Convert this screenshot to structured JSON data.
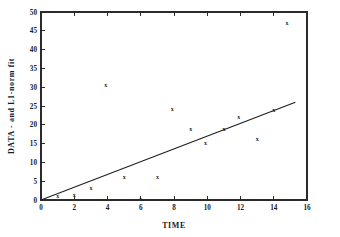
{
  "chart_data": {
    "type": "scatter",
    "title": "",
    "xlabel": "TIME",
    "ylabel": "DATA - and L1-norm fit",
    "xlim": [
      0,
      16
    ],
    "ylim": [
      0,
      50
    ],
    "xticks": [
      0,
      2,
      4,
      6,
      8,
      10,
      12,
      14,
      16
    ],
    "xtick_labels": [
      "0",
      "2",
      "4",
      "6",
      "8",
      "10",
      "12",
      "14",
      "16"
    ],
    "yticks": [
      0,
      5,
      10,
      15,
      20,
      25,
      30,
      35,
      40,
      45,
      50
    ],
    "ytick_labels": [
      "0",
      "5",
      "10",
      "15",
      "20",
      "25",
      "30",
      "35",
      "40",
      "45",
      "50"
    ],
    "grid": false,
    "legend": false,
    "marker_symbol": "x",
    "series": [
      {
        "name": "DATA",
        "type": "scatter",
        "x": [
          1.0,
          2.0,
          3.0,
          3.9,
          5.0,
          6.0,
          7.0,
          7.9,
          9.0,
          9.9,
          11.0,
          11.9,
          13.0,
          14.0,
          14.8
        ],
        "y": [
          1.0,
          1.2,
          3.2,
          30.7,
          6.0,
          0.2,
          6.1,
          24.2,
          19.0,
          15.2,
          19.0,
          22.0,
          16.2,
          24.0,
          47.0
        ]
      },
      {
        "name": "L1-norm fit",
        "type": "line",
        "x": [
          0.0,
          15.3
        ],
        "y": [
          0.0,
          26.0
        ]
      }
    ]
  },
  "axes": {
    "x_title": "TIME",
    "y_title": "DATA - and L1-norm fit"
  }
}
